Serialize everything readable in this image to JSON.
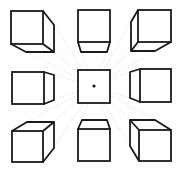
{
  "diagram": {
    "vanishing_point": {
      "x": 94,
      "y": 86
    },
    "colors": {
      "stroke": "#1a1a1a",
      "guide": "#d6d6d6",
      "background": "#ffffff"
    },
    "cubes": [
      {
        "id": "top-left",
        "front": [
          11,
          11,
          32,
          33
        ],
        "paths": [
          "M43 11 L54 25 L54 52 L26 52 L11 44",
          "M43 44 L54 52"
        ]
      },
      {
        "id": "top-center",
        "front": [
          78,
          10,
          32,
          32
        ],
        "paths": [
          "M78 42 L81 52 L107 52 L110 42"
        ]
      },
      {
        "id": "top-right",
        "front": [
          138,
          10,
          33,
          32
        ],
        "paths": [
          "M138 10 L131 22 L131 51 L155 51 L171 42",
          "M138 42 L131 51"
        ]
      },
      {
        "id": "middle-left",
        "front": [
          12,
          72,
          32,
          32
        ],
        "paths": [
          "M44 72 L54 75 L54 100 L44 104"
        ]
      },
      {
        "id": "center",
        "front": [
          78,
          70,
          32,
          33
        ],
        "paths": []
      },
      {
        "id": "middle-right",
        "front": [
          140,
          69,
          31,
          33
        ],
        "paths": [
          "M140 69 L130 72 L130 98 L140 102"
        ]
      },
      {
        "id": "bottom-left",
        "front": [
          12,
          131,
          31,
          31
        ],
        "paths": [
          "M12 131 L27 122 L54 122 L43 131",
          "M54 122 L54 148 L43 162"
        ]
      },
      {
        "id": "bottom-center",
        "front": [
          78,
          129,
          32,
          32
        ],
        "paths": [
          "M78 129 L82 120 L107 120 L110 129"
        ]
      },
      {
        "id": "bottom-right",
        "front": [
          139,
          130,
          32,
          31
        ],
        "paths": [
          "M139 130 L130 120 L155 120 L171 130",
          "M130 120 L130 146 L139 161"
        ]
      }
    ],
    "guides": [
      [
        94,
        86,
        54,
        52
      ],
      [
        94,
        86,
        26,
        52
      ],
      [
        94,
        86,
        54,
        25
      ],
      [
        94,
        86,
        81,
        52
      ],
      [
        94,
        86,
        107,
        52
      ],
      [
        94,
        86,
        131,
        51
      ],
      [
        94,
        86,
        155,
        51
      ],
      [
        94,
        86,
        131,
        22
      ],
      [
        94,
        86,
        54,
        75
      ],
      [
        94,
        86,
        54,
        100
      ],
      [
        94,
        86,
        130,
        72
      ],
      [
        94,
        86,
        130,
        98
      ],
      [
        94,
        86,
        54,
        122
      ],
      [
        94,
        86,
        27,
        122
      ],
      [
        94,
        86,
        54,
        148
      ],
      [
        94,
        86,
        82,
        120
      ],
      [
        94,
        86,
        107,
        120
      ],
      [
        94,
        86,
        130,
        120
      ],
      [
        94,
        86,
        155,
        120
      ],
      [
        94,
        86,
        130,
        146
      ]
    ]
  }
}
